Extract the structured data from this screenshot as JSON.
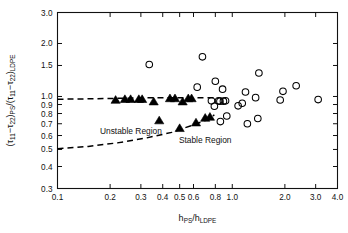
{
  "chart_data": {
    "type": "scatter",
    "title": "",
    "xlabel": "h_PS/h_LDPE",
    "ylabel": "(τ₁₁-τ₂₂)_PS/(τ₁₁-τ₂₂)_LDPE",
    "xscale": "log",
    "yscale": "log",
    "xlim": [
      0.1,
      4.0
    ],
    "ylim": [
      0.3,
      3.0
    ],
    "grid": false,
    "legend": null,
    "xticks": [
      0.1,
      0.2,
      0.3,
      0.4,
      0.5,
      0.6,
      0.8,
      1.0,
      2.0,
      3.0,
      4.0
    ],
    "xticklabels": [
      "0.1",
      "0.2",
      "0.3",
      "0.4",
      "0.5",
      "0.6",
      "0.8",
      "1.0",
      "2.0",
      "3.0",
      "4.0"
    ],
    "yticks": [
      0.3,
      0.4,
      0.5,
      0.6,
      0.7,
      0.8,
      0.9,
      1.0,
      1.5,
      2.0,
      3.0
    ],
    "yticklabels": [
      "0.3",
      "0.4",
      "0.5",
      "0.6",
      "0.7",
      "0.8",
      "0.9",
      "1.0",
      "1.5",
      "2.0",
      "3.0"
    ],
    "annotations": [
      {
        "text": "Unstable Region",
        "x": 0.175,
        "y": 0.615
      },
      {
        "text": "Stable Region",
        "x": 0.7,
        "y": 0.545
      }
    ],
    "series": [
      {
        "name": "filled-triangle",
        "marker": "triangle",
        "filled": true,
        "color": "#000000",
        "points": [
          {
            "x": 0.215,
            "y": 0.955
          },
          {
            "x": 0.243,
            "y": 0.965
          },
          {
            "x": 0.262,
            "y": 0.965
          },
          {
            "x": 0.292,
            "y": 0.965
          },
          {
            "x": 0.305,
            "y": 0.965
          },
          {
            "x": 0.355,
            "y": 0.935
          },
          {
            "x": 0.382,
            "y": 0.73
          },
          {
            "x": 0.44,
            "y": 0.975
          },
          {
            "x": 0.47,
            "y": 0.975
          },
          {
            "x": 0.5,
            "y": 0.66
          },
          {
            "x": 0.52,
            "y": 0.935
          },
          {
            "x": 0.56,
            "y": 0.975
          },
          {
            "x": 0.585,
            "y": 0.975
          },
          {
            "x": 0.62,
            "y": 0.71
          },
          {
            "x": 0.7,
            "y": 0.755
          },
          {
            "x": 0.745,
            "y": 0.765
          }
        ]
      },
      {
        "name": "open-circle",
        "marker": "circle",
        "filled": false,
        "color": "#000000",
        "points": [
          {
            "x": 0.335,
            "y": 1.52
          },
          {
            "x": 0.63,
            "y": 1.13
          },
          {
            "x": 0.675,
            "y": 1.68
          },
          {
            "x": 0.76,
            "y": 0.945
          },
          {
            "x": 0.79,
            "y": 0.88
          },
          {
            "x": 0.8,
            "y": 1.22
          },
          {
            "x": 0.835,
            "y": 0.945
          },
          {
            "x": 0.85,
            "y": 0.94
          },
          {
            "x": 0.855,
            "y": 0.72
          },
          {
            "x": 0.88,
            "y": 1.1
          },
          {
            "x": 0.89,
            "y": 0.94
          },
          {
            "x": 0.915,
            "y": 0.945
          },
          {
            "x": 0.93,
            "y": 0.775
          },
          {
            "x": 1.08,
            "y": 0.885
          },
          {
            "x": 1.14,
            "y": 0.915
          },
          {
            "x": 1.19,
            "y": 1.06
          },
          {
            "x": 1.22,
            "y": 0.7
          },
          {
            "x": 1.36,
            "y": 0.985
          },
          {
            "x": 1.4,
            "y": 0.75
          },
          {
            "x": 1.42,
            "y": 1.36
          },
          {
            "x": 1.88,
            "y": 0.955
          },
          {
            "x": 1.95,
            "y": 1.07
          },
          {
            "x": 2.32,
            "y": 1.15
          },
          {
            "x": 3.1,
            "y": 0.96
          }
        ]
      }
    ],
    "curves": [
      {
        "name": "upper-stability-boundary",
        "style": "dashed",
        "color": "#000000",
        "points": [
          {
            "x": 0.1,
            "y": 0.965
          },
          {
            "x": 0.16,
            "y": 0.97
          },
          {
            "x": 0.25,
            "y": 0.978
          },
          {
            "x": 0.4,
            "y": 0.985
          },
          {
            "x": 0.6,
            "y": 0.985
          },
          {
            "x": 0.78,
            "y": 0.982
          }
        ]
      },
      {
        "name": "lower-stability-boundary",
        "style": "dashed",
        "color": "#000000",
        "points": [
          {
            "x": 0.1,
            "y": 0.505
          },
          {
            "x": 0.15,
            "y": 0.52
          },
          {
            "x": 0.22,
            "y": 0.545
          },
          {
            "x": 0.32,
            "y": 0.58
          },
          {
            "x": 0.45,
            "y": 0.625
          },
          {
            "x": 0.6,
            "y": 0.69
          },
          {
            "x": 0.7,
            "y": 0.73
          },
          {
            "x": 0.79,
            "y": 0.785
          }
        ]
      }
    ]
  },
  "axis": {
    "ylabel_parts": {
      "open1": "(",
      "tau11a": "τ",
      "sub11a": "11",
      "minus_a": "−",
      "tau22a": "τ",
      "sub22a": "22",
      "close1": ")",
      "subPS": "PS",
      "slash": "/",
      "open2": "(",
      "tau11b": "τ",
      "sub11b": "11",
      "minus_b": "−",
      "tau22b": "τ",
      "sub22b": "22",
      "close2": ")",
      "subLDPE": "LDPE"
    },
    "xlabel_parts": {
      "h1": "h",
      "subPS": "PS",
      "slash": "/",
      "h2": "h",
      "subLDPE": "LDPE"
    }
  }
}
